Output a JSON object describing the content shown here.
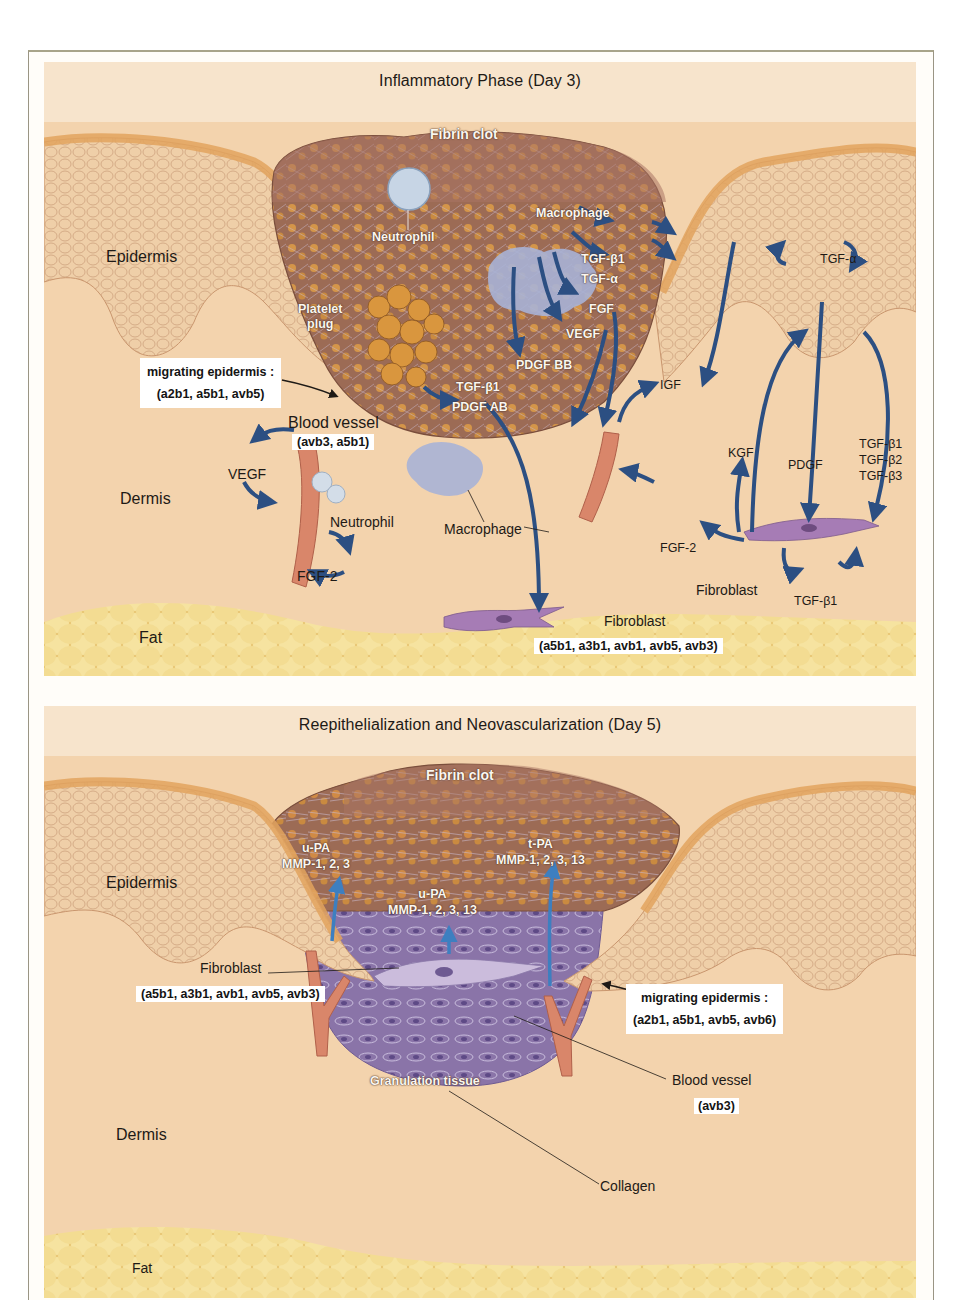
{
  "figure": {
    "panels": [
      {
        "title": "Inflammatory Phase (Day 3)",
        "regions": {
          "epidermis": "Epidermis",
          "dermis": "Dermis",
          "fat": "Fat"
        },
        "structures": {
          "fibrin_clot": "Fibrin clot",
          "neutrophil_in_clot": "Neutrophil",
          "macrophage_in_clot": "Macrophage",
          "platelet_plug": [
            "Platelet",
            "plug"
          ],
          "blood_vessel": "Blood vessel",
          "neutrophil_dermis": "Neutrophil",
          "macrophage_dermis": "Macrophage",
          "fibroblast_bottom": "Fibroblast",
          "fibroblast_right": "Fibroblast"
        },
        "annotation_boxes": {
          "migrating_epidermis": {
            "title": "migrating epidermis :",
            "integrins": "(a2b1, a5b1, avb5)"
          },
          "blood_vessel": {
            "integrins": "(avb3, a5b1)"
          },
          "fibroblast": {
            "integrins": "(a5b1, a3b1, avb1, avb5, avb3)"
          }
        },
        "growth_factors": {
          "macrophage": [
            "TGF-β1",
            "TGF-α",
            "FGF",
            "VEGF",
            "PDGF BB"
          ],
          "platelet": [
            "TGF-β1",
            "PDGF AB"
          ],
          "vessel_left": [
            "VEGF",
            "FGF-2"
          ],
          "right_cluster": {
            "igf": "IGF",
            "kgf": "KGF",
            "pdgf": "PDGF",
            "tgf_betas": [
              "TGF-β1",
              "TGF-β2",
              "TGF-β3"
            ],
            "fgf2": "FGF-2",
            "tgf_alpha": "TGF-α",
            "tgf_beta1_autocrine": "TGF-β1"
          }
        }
      },
      {
        "title": "Reepithelialization and Neovascularization (Day 5)",
        "regions": {
          "epidermis": "Epidermis",
          "dermis": "Dermis",
          "fat": "Fat"
        },
        "structures": {
          "fibrin_clot": "Fibrin clot",
          "fibroblast": "Fibroblast",
          "granulation_tissue": "Granulation tissue",
          "blood_vessel": "Blood vessel",
          "collagen": "Collagen"
        },
        "enzymes": {
          "left": [
            "u-PA",
            "MMP-1, 2, 3"
          ],
          "center": [
            "u-PA",
            "MMP-1, 2, 3, 13"
          ],
          "right": [
            "t-PA",
            "MMP-1, 2, 3, 13"
          ]
        },
        "annotation_boxes": {
          "fibroblast": {
            "integrins": "(a5b1, a3b1, avb1, avb5, avb3)"
          },
          "migrating_epidermis": {
            "title": "migrating epidermis :",
            "integrins": "(a2b1, a5b1, avb5, avb6)"
          },
          "blood_vessel": {
            "integrins": "(avb3)"
          }
        }
      }
    ],
    "colors": {
      "dermis": "#f3d3ad",
      "epidermis": "#ecc9a2",
      "stratum": "#e2a35e",
      "clot": "#9c6b55",
      "platelet": "#d9963e",
      "fat": "#f1da8c",
      "arrow": "#2c4f82",
      "granulation": "#8a74a8",
      "vessel": "#d9866a",
      "fibroblast": "#a67cb5"
    }
  }
}
